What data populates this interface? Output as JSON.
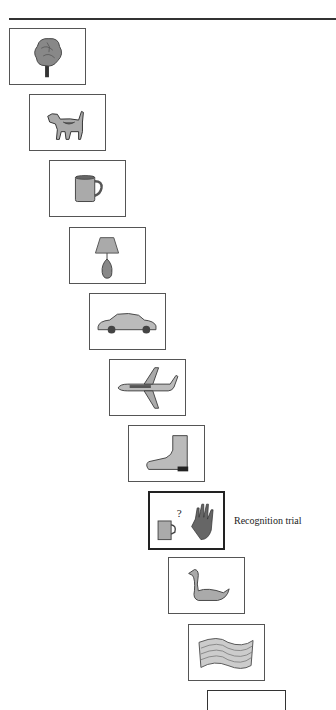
{
  "figure": {
    "trial_label": "Recognition trial",
    "stimuli": [
      {
        "name": "tree",
        "icon": "tree-icon"
      },
      {
        "name": "dog",
        "icon": "dog-icon"
      },
      {
        "name": "mug",
        "icon": "mug-icon"
      },
      {
        "name": "lamp",
        "icon": "lamp-icon"
      },
      {
        "name": "car",
        "icon": "car-icon"
      },
      {
        "name": "airplane",
        "icon": "airplane-icon"
      },
      {
        "name": "boot",
        "icon": "boot-icon"
      },
      {
        "name": "recognition",
        "icon": "mug-question-glove-icon"
      },
      {
        "name": "swan",
        "icon": "swan-icon"
      },
      {
        "name": "scarf",
        "icon": "scarf-icon"
      },
      {
        "name": "next",
        "icon": "empty-card"
      }
    ],
    "recognition_symbol": "?"
  }
}
